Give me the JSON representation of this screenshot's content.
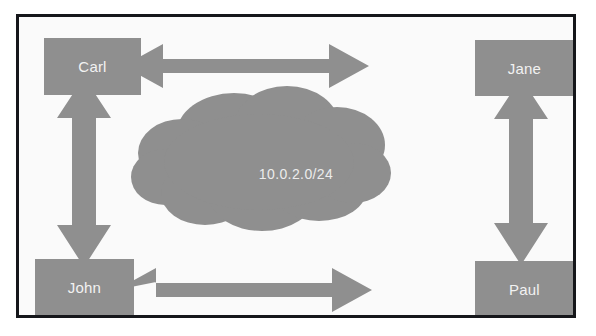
{
  "diagram": {
    "type": "network-topology",
    "background_color": "#fafafa",
    "frame_color": "#15161a",
    "shape_fill_color": "#8f8f8f",
    "label_color": "#f2f2f2",
    "nodes": [
      {
        "id": "carl",
        "label": "Carl",
        "position": "top-left"
      },
      {
        "id": "jane",
        "label": "Jane",
        "position": "top-right"
      },
      {
        "id": "john",
        "label": "John",
        "position": "bottom-left"
      },
      {
        "id": "paul",
        "label": "Paul",
        "position": "bottom-right"
      }
    ],
    "cloud": {
      "label": "10.0.2.0/24",
      "icon": "network-cloud-icon"
    },
    "connections": [
      {
        "id": "carl-jane",
        "from": "Carl",
        "to": "Jane",
        "orientation": "horizontal",
        "arrowheads": "both"
      },
      {
        "id": "john-paul",
        "from": "John",
        "to": "Paul",
        "orientation": "horizontal",
        "arrowheads": "both"
      },
      {
        "id": "carl-john",
        "from": "Carl",
        "to": "John",
        "orientation": "vertical",
        "arrowheads": "both"
      },
      {
        "id": "jane-paul",
        "from": "Jane",
        "to": "Paul",
        "orientation": "vertical",
        "arrowheads": "both"
      }
    ]
  }
}
